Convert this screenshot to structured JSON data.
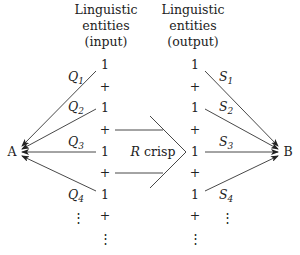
{
  "input_header": [
    "Linguistic",
    "entities",
    "(input)"
  ],
  "output_header": [
    "Linguistic",
    "entities",
    "(output)"
  ],
  "input_column": [
    "1",
    "+",
    "1",
    "+",
    "1",
    "+",
    "1",
    "+",
    "⋮"
  ],
  "output_column": [
    "1",
    "+",
    "1",
    "+",
    "1",
    "+",
    "1",
    "+",
    "⋮"
  ],
  "source_node": "A",
  "target_node": "B",
  "relation_label": {
    "symbol": "R",
    "text": "crisp"
  },
  "input_arrows": [
    {
      "label": "Q",
      "sub": "1"
    },
    {
      "label": "Q",
      "sub": "2"
    },
    {
      "label": "Q",
      "sub": "3"
    },
    {
      "label": "Q",
      "sub": "4"
    }
  ],
  "output_arrows": [
    {
      "label": "S",
      "sub": "1"
    },
    {
      "label": "S",
      "sub": "2"
    },
    {
      "label": "S",
      "sub": "3"
    },
    {
      "label": "S",
      "sub": "4"
    }
  ],
  "ellipsis": "⋮"
}
